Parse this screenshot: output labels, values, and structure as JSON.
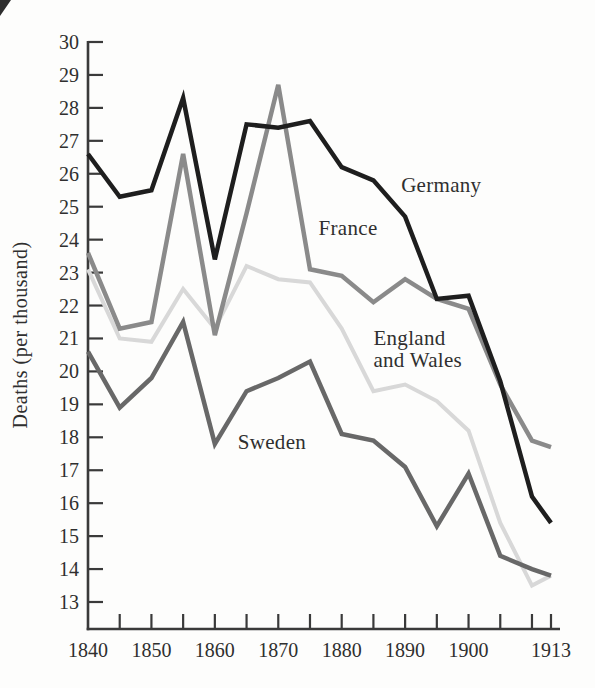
{
  "figure": {
    "title": "",
    "background": "#fdfdfc",
    "axis_color": "#3a3a3a",
    "text_color": "#2f2f2f"
  },
  "chart_data": {
    "type": "line",
    "title": "",
    "xlabel": "",
    "ylabel": "Deaths (per thousand)",
    "xlim": [
      1840,
      1913
    ],
    "ylim": [
      13,
      30
    ],
    "grid": false,
    "legend_position": "inline-annotations",
    "x": [
      1840,
      1845,
      1850,
      1855,
      1860,
      1865,
      1870,
      1875,
      1880,
      1885,
      1890,
      1895,
      1900,
      1905,
      1910,
      1913
    ],
    "y_ticks": [
      13,
      14,
      15,
      16,
      17,
      18,
      19,
      20,
      21,
      22,
      23,
      24,
      25,
      26,
      27,
      28,
      29,
      30
    ],
    "x_ticks": [
      1845,
      1850,
      1855,
      1860,
      1865,
      1870,
      1875,
      1880,
      1885,
      1890,
      1895,
      1900,
      1905,
      1910,
      1913
    ],
    "x_labeled_ticks": [
      "1840",
      "1850",
      "1860",
      "1870",
      "1880",
      "1890",
      "1900",
      "1913"
    ],
    "x_labeled_tick_years": [
      1840,
      1850,
      1860,
      1870,
      1880,
      1890,
      1900,
      1913
    ],
    "series": [
      {
        "name": "England and Wales",
        "key": "england-and-wales",
        "color": "#d8d8d8",
        "stroke_width": 4,
        "values": [
          23.1,
          21.0,
          20.9,
          22.5,
          21.3,
          23.2,
          22.8,
          22.7,
          21.3,
          19.4,
          19.6,
          19.1,
          18.2,
          15.4,
          13.5,
          13.8
        ],
        "annotation": {
          "lines": [
            "England",
            "and Wales"
          ],
          "year": 1885,
          "value": 21.0,
          "anchor": "start",
          "line_height": 22
        }
      },
      {
        "name": "France",
        "key": "france",
        "color": "#8a8a8a",
        "stroke_width": 4.5,
        "values": [
          23.6,
          21.3,
          21.5,
          26.6,
          21.1,
          24.8,
          28.7,
          23.1,
          22.9,
          22.1,
          22.8,
          22.2,
          21.9,
          19.6,
          17.9,
          17.7
        ],
        "annotation": {
          "lines": [
            "France"
          ],
          "year": 1881,
          "value": 24.35,
          "anchor": "middle",
          "line_height": 22
        }
      },
      {
        "name": "Sweden",
        "key": "sweden",
        "color": "#686868",
        "stroke_width": 4.5,
        "values": [
          20.6,
          18.9,
          19.8,
          21.5,
          17.8,
          19.4,
          19.8,
          20.3,
          18.1,
          17.9,
          17.1,
          15.3,
          16.9,
          14.4,
          14.0,
          13.8
        ],
        "annotation": {
          "lines": [
            "Sweden"
          ],
          "year": 1869,
          "value": 17.86,
          "anchor": "middle",
          "line_height": 22
        }
      },
      {
        "name": "Germany",
        "key": "germany",
        "color": "#1e1e1e",
        "stroke_width": 4.5,
        "values": [
          26.6,
          25.3,
          25.5,
          28.3,
          23.4,
          27.5,
          27.4,
          27.6,
          26.2,
          25.8,
          24.7,
          22.2,
          22.3,
          19.7,
          16.2,
          15.4
        ],
        "annotation": {
          "lines": [
            "Germany"
          ],
          "year": 1895.7,
          "value": 25.65,
          "anchor": "middle",
          "line_height": 22
        }
      }
    ]
  }
}
